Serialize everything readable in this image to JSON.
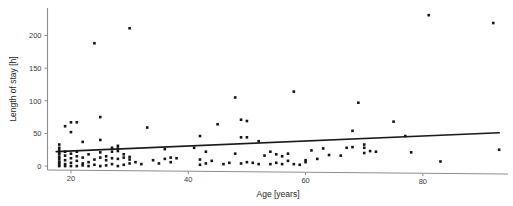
{
  "chart_data": {
    "type": "scatter",
    "title": "",
    "xlabel": "Age [years]",
    "ylabel": "Length of stay [h]",
    "xlim": [
      16,
      94
    ],
    "ylim": [
      -6,
      242
    ],
    "xticks": [
      20,
      40,
      60,
      80
    ],
    "yticks": [
      0,
      50,
      100,
      150,
      200
    ],
    "xtick_labels": [
      "20",
      "40",
      "60",
      "80"
    ],
    "ytick_labels": [
      "0",
      "50",
      "100",
      "150",
      "200"
    ],
    "grid": false,
    "legend": null,
    "marker": "square",
    "marker_color": "#151515",
    "axis_color": "#8d8d8d",
    "series": [
      {
        "name": "patients",
        "points": [
          [
            18,
            0
          ],
          [
            18,
            2
          ],
          [
            18,
            7
          ],
          [
            18,
            11
          ],
          [
            18,
            14
          ],
          [
            18,
            18
          ],
          [
            18,
            21
          ],
          [
            18,
            24
          ],
          [
            18,
            28
          ],
          [
            18,
            33
          ],
          [
            18,
            5
          ],
          [
            19,
            0
          ],
          [
            19,
            3
          ],
          [
            19,
            9
          ],
          [
            19,
            16
          ],
          [
            19,
            22
          ],
          [
            19,
            61
          ],
          [
            20,
            0
          ],
          [
            20,
            5
          ],
          [
            20,
            12
          ],
          [
            20,
            19
          ],
          [
            20,
            52
          ],
          [
            20,
            67
          ],
          [
            21,
            0
          ],
          [
            21,
            8
          ],
          [
            21,
            15
          ],
          [
            21,
            22
          ],
          [
            21,
            67
          ],
          [
            22,
            1
          ],
          [
            22,
            4
          ],
          [
            22,
            37
          ],
          [
            22,
            13
          ],
          [
            23,
            0
          ],
          [
            23,
            6
          ],
          [
            23,
            18
          ],
          [
            24,
            2
          ],
          [
            24,
            10
          ],
          [
            24,
            188
          ],
          [
            25,
            0
          ],
          [
            25,
            13
          ],
          [
            25,
            40
          ],
          [
            25,
            75
          ],
          [
            25,
            21
          ],
          [
            26,
            1
          ],
          [
            26,
            9
          ],
          [
            26,
            15
          ],
          [
            27,
            3
          ],
          [
            27,
            12
          ],
          [
            27,
            22
          ],
          [
            27,
            28
          ],
          [
            28,
            0
          ],
          [
            28,
            11
          ],
          [
            28,
            23
          ],
          [
            28,
            27
          ],
          [
            28,
            31
          ],
          [
            29,
            2
          ],
          [
            29,
            13
          ],
          [
            29,
            18
          ],
          [
            30,
            4
          ],
          [
            30,
            10
          ],
          [
            30,
            14
          ],
          [
            30,
            211
          ],
          [
            31,
            6
          ],
          [
            32,
            3
          ],
          [
            33,
            59
          ],
          [
            34,
            9
          ],
          [
            35,
            4
          ],
          [
            36,
            11
          ],
          [
            36,
            26
          ],
          [
            37,
            6
          ],
          [
            37,
            13
          ],
          [
            38,
            12
          ],
          [
            41,
            28
          ],
          [
            42,
            2
          ],
          [
            42,
            10
          ],
          [
            42,
            46
          ],
          [
            43,
            4
          ],
          [
            43,
            22
          ],
          [
            44,
            8
          ],
          [
            45,
            64
          ],
          [
            46,
            3
          ],
          [
            47,
            5
          ],
          [
            48,
            105
          ],
          [
            48,
            19
          ],
          [
            49,
            4
          ],
          [
            49,
            44
          ],
          [
            49,
            71
          ],
          [
            50,
            6
          ],
          [
            50,
            44
          ],
          [
            50,
            69
          ],
          [
            51,
            5
          ],
          [
            52,
            3
          ],
          [
            52,
            38
          ],
          [
            53,
            16
          ],
          [
            54,
            3
          ],
          [
            54,
            22
          ],
          [
            55,
            5
          ],
          [
            55,
            18
          ],
          [
            56,
            3
          ],
          [
            56,
            15
          ],
          [
            57,
            19
          ],
          [
            57,
            8
          ],
          [
            58,
            3
          ],
          [
            58,
            114
          ],
          [
            59,
            2
          ],
          [
            60,
            6
          ],
          [
            60,
            9
          ],
          [
            61,
            24
          ],
          [
            62,
            11
          ],
          [
            63,
            27
          ],
          [
            64,
            17
          ],
          [
            66,
            16
          ],
          [
            67,
            28
          ],
          [
            68,
            29
          ],
          [
            68,
            54
          ],
          [
            69,
            97
          ],
          [
            70,
            20
          ],
          [
            70,
            28
          ],
          [
            70,
            33
          ],
          [
            71,
            23
          ],
          [
            72,
            22
          ],
          [
            75,
            68
          ],
          [
            77,
            46
          ],
          [
            78,
            21
          ],
          [
            81,
            231
          ],
          [
            83,
            7
          ],
          [
            92,
            219
          ],
          [
            93,
            25
          ]
        ]
      }
    ],
    "trend_line": {
      "name": "linear fit",
      "x_start": 17.5,
      "y_start": 22,
      "x_end": 93,
      "y_end": 51
    }
  }
}
